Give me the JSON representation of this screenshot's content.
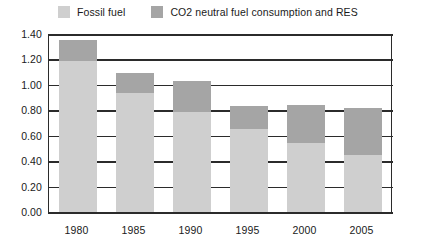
{
  "legend": {
    "position": "top-left",
    "entries": [
      {
        "label": "Fossil fuel",
        "color": "#cfcfcf",
        "swatch_icon": "legend-swatch-icon"
      },
      {
        "label": "CO2 neutral fuel consumption and RES",
        "color": "#a5a5a5",
        "swatch_icon": "legend-swatch-icon"
      }
    ]
  },
  "axes": {
    "y_ticks": [
      "0.00",
      "0.20",
      "0.40",
      "0.60",
      "0.80",
      "1.00",
      "1.20",
      "1.40"
    ],
    "x_ticks": [
      "1980",
      "1985",
      "1990",
      "1995",
      "2000",
      "2005"
    ]
  },
  "colors": {
    "fossil_fuel": "#cfcfcf",
    "co2_neutral": "#a5a5a5",
    "gridline": "#2b2b2b",
    "text": "#1a1a1a",
    "background": "#ffffff"
  },
  "chart_data": {
    "type": "bar",
    "stacked": true,
    "title": "",
    "subtitle": "",
    "xlabel": "",
    "ylabel": "",
    "categories": [
      "1980",
      "1985",
      "1990",
      "1995",
      "2000",
      "2005"
    ],
    "series": [
      {
        "name": "Fossil fuel",
        "color": "#cfcfcf",
        "values": [
          1.19,
          0.94,
          0.79,
          0.65,
          0.54,
          0.45
        ]
      },
      {
        "name": "CO2 neutral fuel consumption and RES",
        "color": "#a5a5a5",
        "values": [
          0.16,
          0.15,
          0.24,
          0.18,
          0.3,
          0.37
        ]
      }
    ],
    "totals": [
      1.35,
      1.09,
      1.03,
      0.83,
      0.84,
      0.82
    ],
    "ylim": [
      0.0,
      1.4
    ],
    "ytick_step": 0.2,
    "grid": true,
    "grid_axis": "y",
    "legend_position": "top-left"
  }
}
